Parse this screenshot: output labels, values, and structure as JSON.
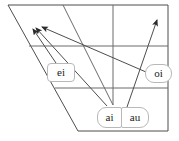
{
  "figure": {
    "name": "vowel-quadrilateral-diphthongs",
    "stroke_color": "#4d4d4d",
    "label_border_color": "#b8b8b8",
    "label_fill_color": "#ffffff",
    "text_color": "#1a1a1a"
  },
  "quadrilateral": {
    "top_left": [
      8,
      5
    ],
    "top_right": [
      168,
      5
    ],
    "bottom_right": [
      168,
      131
    ],
    "bottom_left": [
      78,
      131
    ],
    "horizontal_lines": [
      {
        "name": "mid-high-line",
        "y": 46,
        "x1": 29,
        "x2": 168
      },
      {
        "name": "mid-low-line",
        "y": 88,
        "x1": 55,
        "x2": 168
      }
    ],
    "vertical_line": {
      "name": "center-line",
      "x": 113,
      "y1": 5,
      "y2": 105
    },
    "inner_diagonal": {
      "name": "inner-diagonal",
      "x1": 63,
      "y1": 5,
      "x2": 113,
      "y2": 105
    }
  },
  "labels": {
    "ei": "ei",
    "oi": "oi",
    "ai": "ai",
    "au": "au"
  },
  "arrows": [
    {
      "name": "ei-arrow",
      "label": "ei",
      "x1": 58,
      "y1": 66,
      "x2": 33,
      "y2": 29
    },
    {
      "name": "ai-arrow",
      "label": "ai",
      "x1": 107,
      "y1": 106,
      "x2": 36,
      "y2": 28
    },
    {
      "name": "oi-arrow",
      "label": "oi",
      "x1": 146,
      "y1": 72,
      "x2": 42,
      "y2": 27
    },
    {
      "name": "au-arrow",
      "label": "au",
      "x1": 127,
      "y1": 107,
      "x2": 157,
      "y2": 20
    }
  ]
}
